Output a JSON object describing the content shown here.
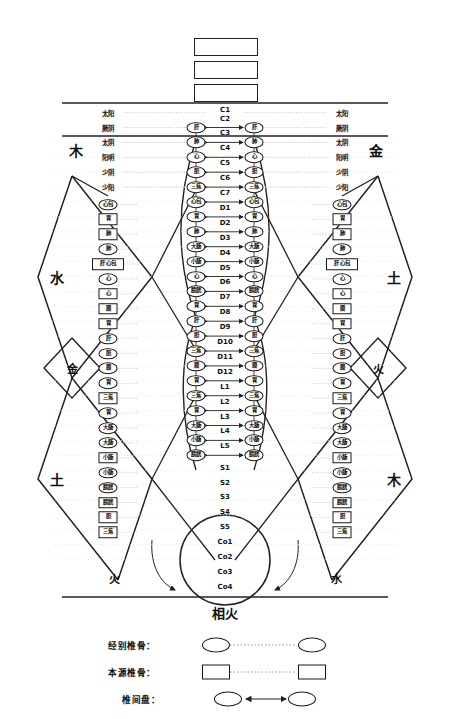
{
  "diagram": {
    "title_boxes": [
      "",
      "",
      ""
    ],
    "bottom_center_label": "相火",
    "element_labels": {
      "left_top": "木",
      "right_top": "金",
      "left_mid": "水",
      "right_mid": "土",
      "left_inner": "金",
      "right_inner": "火",
      "left_bottom": "土",
      "right_bottom": "木",
      "left_bottom_inner": "火",
      "right_bottom_inner": "水"
    },
    "meridians_left": [
      "太阳",
      "厥阴",
      "太阴",
      "阳明",
      "少阴",
      "少阳"
    ],
    "meridians_right": [
      "太阳",
      "厥阴",
      "太阴",
      "阳明",
      "少阴",
      "少阳"
    ],
    "vertebrae": [
      {
        "id": "C1",
        "organ": null
      },
      {
        "id": "C2",
        "organ": "肝"
      },
      {
        "id": "C3",
        "organ": "肺"
      },
      {
        "id": "C4",
        "organ": "心"
      },
      {
        "id": "C5",
        "organ": "胆"
      },
      {
        "id": "C6",
        "organ": "三焦"
      },
      {
        "id": "C7",
        "organ": "心包"
      },
      {
        "id": "D1",
        "organ": "胃"
      },
      {
        "id": "D2",
        "organ": "肺"
      },
      {
        "id": "D3",
        "organ": "大肠"
      },
      {
        "id": "D4",
        "organ": "小肠"
      },
      {
        "id": "D5",
        "organ": "心"
      },
      {
        "id": "D6",
        "organ": "膀胱"
      },
      {
        "id": "D7",
        "organ": "胃"
      },
      {
        "id": "D8",
        "organ": "肝"
      },
      {
        "id": "D9",
        "organ": "胆"
      },
      {
        "id": "D10",
        "organ": "三焦"
      },
      {
        "id": "D11",
        "organ": "膜"
      },
      {
        "id": "D12",
        "organ": "胃"
      },
      {
        "id": "L1",
        "organ": "三焦"
      },
      {
        "id": "L2",
        "organ": "胃"
      },
      {
        "id": "L3",
        "organ": "大肠"
      },
      {
        "id": "L4",
        "organ": "小肠"
      },
      {
        "id": "L5",
        "organ": "膀胱"
      },
      {
        "id": "S1",
        "organ": null
      },
      {
        "id": "S2",
        "organ": null
      },
      {
        "id": "S3",
        "organ": null
      },
      {
        "id": "S4",
        "organ": null
      },
      {
        "id": "S5",
        "organ": null
      },
      {
        "id": "Co1",
        "organ": null
      },
      {
        "id": "Co2",
        "organ": null
      },
      {
        "id": "Co3",
        "organ": null
      },
      {
        "id": "Co4",
        "organ": null
      }
    ],
    "outer_column": [
      {
        "shape": "ellipse",
        "text": "心包"
      },
      {
        "shape": "rect",
        "text": "胃"
      },
      {
        "shape": "rect",
        "text": "肺"
      },
      {
        "shape": "ellipse",
        "text": "肺"
      },
      {
        "shape": "rect",
        "text": "肝 心包",
        "wide": true
      },
      {
        "shape": "ellipse",
        "text": "心"
      },
      {
        "shape": "rect",
        "text": "心"
      },
      {
        "shape": "rect",
        "text": "膜"
      },
      {
        "shape": "rect",
        "text": "胃"
      },
      {
        "shape": "ellipse",
        "text": "肝"
      },
      {
        "shape": "ellipse",
        "text": "胆"
      },
      {
        "shape": "ellipse",
        "text": "膜"
      },
      {
        "shape": "ellipse",
        "text": "胃"
      },
      {
        "shape": "rect",
        "text": "三焦"
      },
      {
        "shape": "ellipse",
        "text": "胃"
      },
      {
        "shape": "ellipse",
        "text": "大肠"
      },
      {
        "shape": "ellipse",
        "text": "大肠"
      },
      {
        "shape": "rect",
        "text": "小肠"
      },
      {
        "shape": "ellipse",
        "text": "小肠"
      },
      {
        "shape": "ellipse",
        "text": "膀胱"
      },
      {
        "shape": "rect",
        "text": "膀胱"
      },
      {
        "shape": "rect",
        "text": "胆"
      },
      {
        "shape": "rect",
        "text": "三焦"
      }
    ]
  },
  "legend": {
    "rows": [
      {
        "label": "经别椎骨：",
        "shape": "ellipse",
        "connector": "dotted"
      },
      {
        "label": "本源椎骨：",
        "shape": "rect",
        "connector": "dotted"
      },
      {
        "label": "椎间盘：",
        "shape": "ellipse",
        "connector": "arrow"
      }
    ]
  }
}
